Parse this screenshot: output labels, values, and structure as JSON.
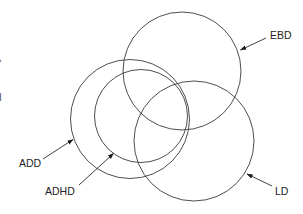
{
  "diagram": {
    "type": "venn",
    "stroke_color": "#3a3a3a",
    "text_color": "#222222",
    "sets": [
      {
        "id": "ebd",
        "label": "EBD",
        "cx": 182,
        "cy": 71,
        "r": 59
      },
      {
        "id": "add",
        "label": "ADD",
        "cx": 130,
        "cy": 119,
        "r": 59.5
      },
      {
        "id": "adhd",
        "label": "ADHD",
        "cx": 141,
        "cy": 116,
        "r": 46.5
      },
      {
        "id": "ld",
        "label": "LD",
        "cx": 194,
        "cy": 141,
        "r": 60
      }
    ],
    "labels": {
      "ebd": "EBD",
      "add": "ADD",
      "adhd": "ADHD",
      "ld": "LD"
    },
    "cutoff_text_fragments": [
      ",",
      "d"
    ]
  }
}
